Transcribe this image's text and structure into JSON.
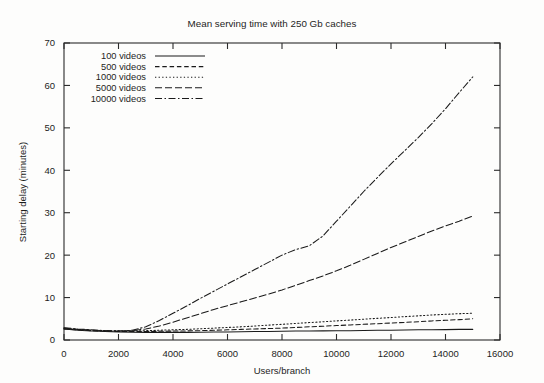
{
  "chart_data": {
    "type": "line",
    "title": "Mean serving time with 250 Gb caches",
    "xlabel": "Users/branch",
    "ylabel": "Starting delay (minutes)",
    "xlim": [
      0,
      16000
    ],
    "ylim": [
      0,
      70
    ],
    "xticks": [
      0,
      2000,
      4000,
      6000,
      8000,
      10000,
      12000,
      14000,
      16000
    ],
    "yticks": [
      0,
      10,
      20,
      30,
      40,
      50,
      60,
      70
    ],
    "grid": false,
    "legend_position": "top-left inside",
    "x": [
      0,
      500,
      1000,
      1500,
      2000,
      2500,
      3000,
      3500,
      4000,
      4500,
      5000,
      5500,
      6000,
      6500,
      7000,
      7500,
      8000,
      8500,
      9000,
      9500,
      10000,
      10500,
      11000,
      11500,
      12000,
      12500,
      13000,
      13500,
      14000,
      14500,
      15000
    ],
    "series": [
      {
        "name": "100 videos",
        "dash": "solid",
        "values": [
          2.6,
          2.3,
          2.1,
          2.0,
          1.9,
          1.85,
          1.8,
          1.8,
          1.8,
          1.8,
          1.85,
          1.9,
          1.9,
          1.95,
          2.0,
          2.0,
          2.05,
          2.1,
          2.1,
          2.15,
          2.2,
          2.2,
          2.25,
          2.3,
          2.3,
          2.35,
          2.4,
          2.4,
          2.45,
          2.5,
          2.5
        ]
      },
      {
        "name": "500 videos",
        "dash": "dashed",
        "values": [
          2.6,
          2.4,
          2.2,
          2.1,
          2.0,
          2.0,
          2.0,
          2.05,
          2.1,
          2.15,
          2.2,
          2.3,
          2.4,
          2.5,
          2.6,
          2.7,
          2.8,
          2.95,
          3.1,
          3.25,
          3.4,
          3.55,
          3.7,
          3.85,
          4.0,
          4.15,
          4.3,
          4.5,
          4.65,
          4.8,
          5.0
        ]
      },
      {
        "name": "1000 videos",
        "dash": "dotted",
        "values": [
          2.7,
          2.5,
          2.3,
          2.2,
          2.15,
          2.15,
          2.2,
          2.3,
          2.4,
          2.5,
          2.65,
          2.8,
          2.95,
          3.1,
          3.3,
          3.5,
          3.7,
          3.9,
          4.1,
          4.3,
          4.5,
          4.7,
          4.9,
          5.1,
          5.3,
          5.5,
          5.7,
          5.9,
          6.05,
          6.2,
          6.3
        ]
      },
      {
        "name": "5000 videos",
        "dash": "longdash",
        "values": [
          2.8,
          2.5,
          2.3,
          2.2,
          2.1,
          2.2,
          2.6,
          3.3,
          4.2,
          5.2,
          6.2,
          7.2,
          8.1,
          9.0,
          9.9,
          10.8,
          11.8,
          12.9,
          14.0,
          15.1,
          16.3,
          17.6,
          19.0,
          20.4,
          21.8,
          23.1,
          24.4,
          25.7,
          26.9,
          28.0,
          29.2
        ]
      },
      {
        "name": "10000 videos",
        "dash": "dashdot",
        "values": [
          2.9,
          2.6,
          2.4,
          2.2,
          2.1,
          2.3,
          3.1,
          4.6,
          6.3,
          8.0,
          9.8,
          11.5,
          13.2,
          14.9,
          16.6,
          18.3,
          20.0,
          21.3,
          22.2,
          24.5,
          28.0,
          31.5,
          35.0,
          38.3,
          41.5,
          44.6,
          47.7,
          51.0,
          54.5,
          58.3,
          62.0
        ]
      }
    ]
  },
  "legend": {
    "items": [
      {
        "label": "100 videos"
      },
      {
        "label": "500 videos"
      },
      {
        "label": "1000 videos"
      },
      {
        "label": "5000 videos"
      },
      {
        "label": "10000 videos"
      }
    ]
  }
}
